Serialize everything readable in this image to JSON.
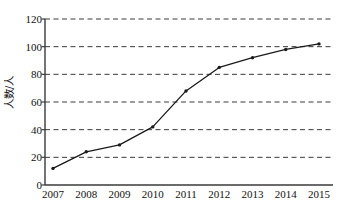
{
  "chart_data": {
    "type": "line",
    "title": "",
    "subtitle": "",
    "xlabel": "",
    "ylabel": "人数/人",
    "categories": [
      "2007",
      "2008",
      "2009",
      "2010",
      "2011",
      "2012",
      "2013",
      "2014",
      "2015"
    ],
    "values": [
      12,
      24,
      29,
      42,
      68,
      85,
      92,
      98,
      102
    ],
    "series": [
      {
        "name": "人数/人",
        "values": [
          12,
          24,
          29,
          42,
          68,
          85,
          92,
          98,
          102
        ]
      }
    ],
    "x": [
      2007,
      2008,
      2009,
      2010,
      2011,
      2012,
      2013,
      2014,
      2015
    ],
    "ylim": [
      0,
      120
    ],
    "ytick_values": [
      0,
      20,
      40,
      60,
      80,
      100,
      120
    ],
    "ytick_labels": [
      "0",
      "20",
      "40",
      "60",
      "80",
      "100",
      "120"
    ],
    "xtick_labels": [
      "2007",
      "2008",
      "2009",
      "2010",
      "2011",
      "2012",
      "2013",
      "2014",
      "2015"
    ],
    "grid": "horizontal-dashed",
    "legend": "none",
    "annotations": [],
    "colors": {
      "line": "#1a1a1a",
      "marker": "#1a1a1a",
      "grid": "#3a3a3a",
      "axis": "#3a3a3a",
      "background": "#ffffff"
    },
    "marker_style": "dot",
    "line_width": 1.3
  }
}
